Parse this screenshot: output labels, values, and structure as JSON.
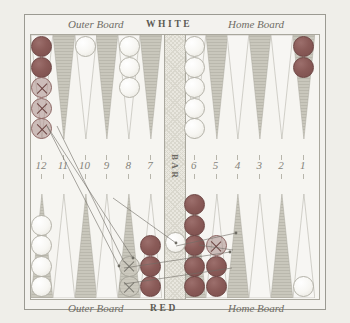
{
  "figure": {
    "top_player": "WHITE",
    "bottom_player": "RED",
    "outer_board_label": "Outer Board",
    "home_board_label": "Home Board",
    "bar_label": "BAR"
  },
  "point_numbers": [
    "12",
    "11",
    "10",
    "9",
    "8",
    "7",
    "6",
    "5",
    "4",
    "3",
    "2",
    "1"
  ],
  "colors": {
    "board_background": "#f6f5f1",
    "frame": "#9b9a92",
    "point_dark": "#c9c7bc",
    "point_light": "#f6f5f1",
    "checker_red": "#8a5b58",
    "checker_white": "#f7f6f2",
    "bar": "#e9e7df",
    "text": "#6f6d66",
    "page_background": "#efeee9"
  },
  "chart_data": {
    "type": "diagram",
    "xlabel": "",
    "ylabel": "",
    "quadrants": [
      {
        "name": "white-outer-board",
        "position": "top-left",
        "label": "Outer Board"
      },
      {
        "name": "white-home-board",
        "position": "top-right",
        "label": "Home Board"
      },
      {
        "name": "red-outer-board",
        "position": "bottom-left",
        "label": "Outer Board"
      },
      {
        "name": "red-home-board",
        "position": "bottom-right",
        "label": "Home Board"
      }
    ],
    "top_points": [
      {
        "number": "12",
        "shade": "light",
        "checkers": 5,
        "color": "red",
        "ghost_from": 3
      },
      {
        "number": "11",
        "shade": "dark",
        "checkers": 0,
        "color": null,
        "ghost_from": 0
      },
      {
        "number": "10",
        "shade": "light",
        "checkers": 1,
        "color": "white",
        "ghost_from": 0
      },
      {
        "number": "9",
        "shade": "dark",
        "checkers": 0,
        "color": null,
        "ghost_from": 0
      },
      {
        "number": "8",
        "shade": "light",
        "checkers": 3,
        "color": "white",
        "ghost_from": 0
      },
      {
        "number": "7",
        "shade": "dark",
        "checkers": 0,
        "color": null,
        "ghost_from": 0
      },
      {
        "number": "6",
        "shade": "light",
        "checkers": 5,
        "color": "white",
        "ghost_from": 0
      },
      {
        "number": "5",
        "shade": "dark",
        "checkers": 0,
        "color": null,
        "ghost_from": 0
      },
      {
        "number": "4",
        "shade": "light",
        "checkers": 0,
        "color": null,
        "ghost_from": 0
      },
      {
        "number": "3",
        "shade": "dark",
        "checkers": 0,
        "color": null,
        "ghost_from": 0
      },
      {
        "number": "2",
        "shade": "light",
        "checkers": 0,
        "color": null,
        "ghost_from": 0
      },
      {
        "number": "1",
        "shade": "dark",
        "checkers": 2,
        "color": "red",
        "ghost_from": 0
      }
    ],
    "bottom_points": [
      {
        "number": "13",
        "shade": "dark",
        "checkers": 4,
        "color": "white",
        "ghost_from": 0
      },
      {
        "number": "14",
        "shade": "light",
        "checkers": 0,
        "color": null,
        "ghost_from": 0
      },
      {
        "number": "15",
        "shade": "dark",
        "checkers": 0,
        "color": null,
        "ghost_from": 0
      },
      {
        "number": "16",
        "shade": "light",
        "checkers": 0,
        "color": null,
        "ghost_from": 0
      },
      {
        "number": "17",
        "shade": "dark",
        "checkers": 2,
        "color": "white",
        "ghost_from": 2
      },
      {
        "number": "18",
        "shade": "light",
        "checkers": 3,
        "color": "red",
        "ghost_from": 0
      },
      {
        "number": "19",
        "shade": "dark",
        "checkers": 5,
        "color": "red",
        "ghost_from": 0
      },
      {
        "number": "20",
        "shade": "light",
        "checkers": 3,
        "color": "red",
        "ghost_from": 1
      },
      {
        "number": "21",
        "shade": "dark",
        "checkers": 0,
        "color": null,
        "ghost_from": 0
      },
      {
        "number": "22",
        "shade": "light",
        "checkers": 0,
        "color": null,
        "ghost_from": 0
      },
      {
        "number": "23",
        "shade": "dark",
        "checkers": 0,
        "color": null,
        "ghost_from": 0
      },
      {
        "number": "24",
        "shade": "light",
        "checkers": 1,
        "color": "white",
        "ghost_from": 0
      }
    ],
    "bar_checkers": [
      {
        "color": "white",
        "count": 1
      }
    ],
    "move_lines": 6,
    "legend": [],
    "grid": false
  }
}
